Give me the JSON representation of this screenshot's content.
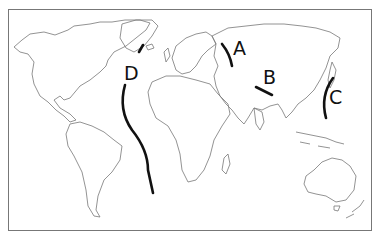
{
  "map": {
    "type": "world outline map",
    "labels": [
      {
        "id": "A",
        "text": "A"
      },
      {
        "id": "B",
        "text": "B"
      },
      {
        "id": "C",
        "text": "C"
      },
      {
        "id": "D",
        "text": "D"
      }
    ],
    "line_color": "#111111",
    "outline_color": "#666666"
  }
}
